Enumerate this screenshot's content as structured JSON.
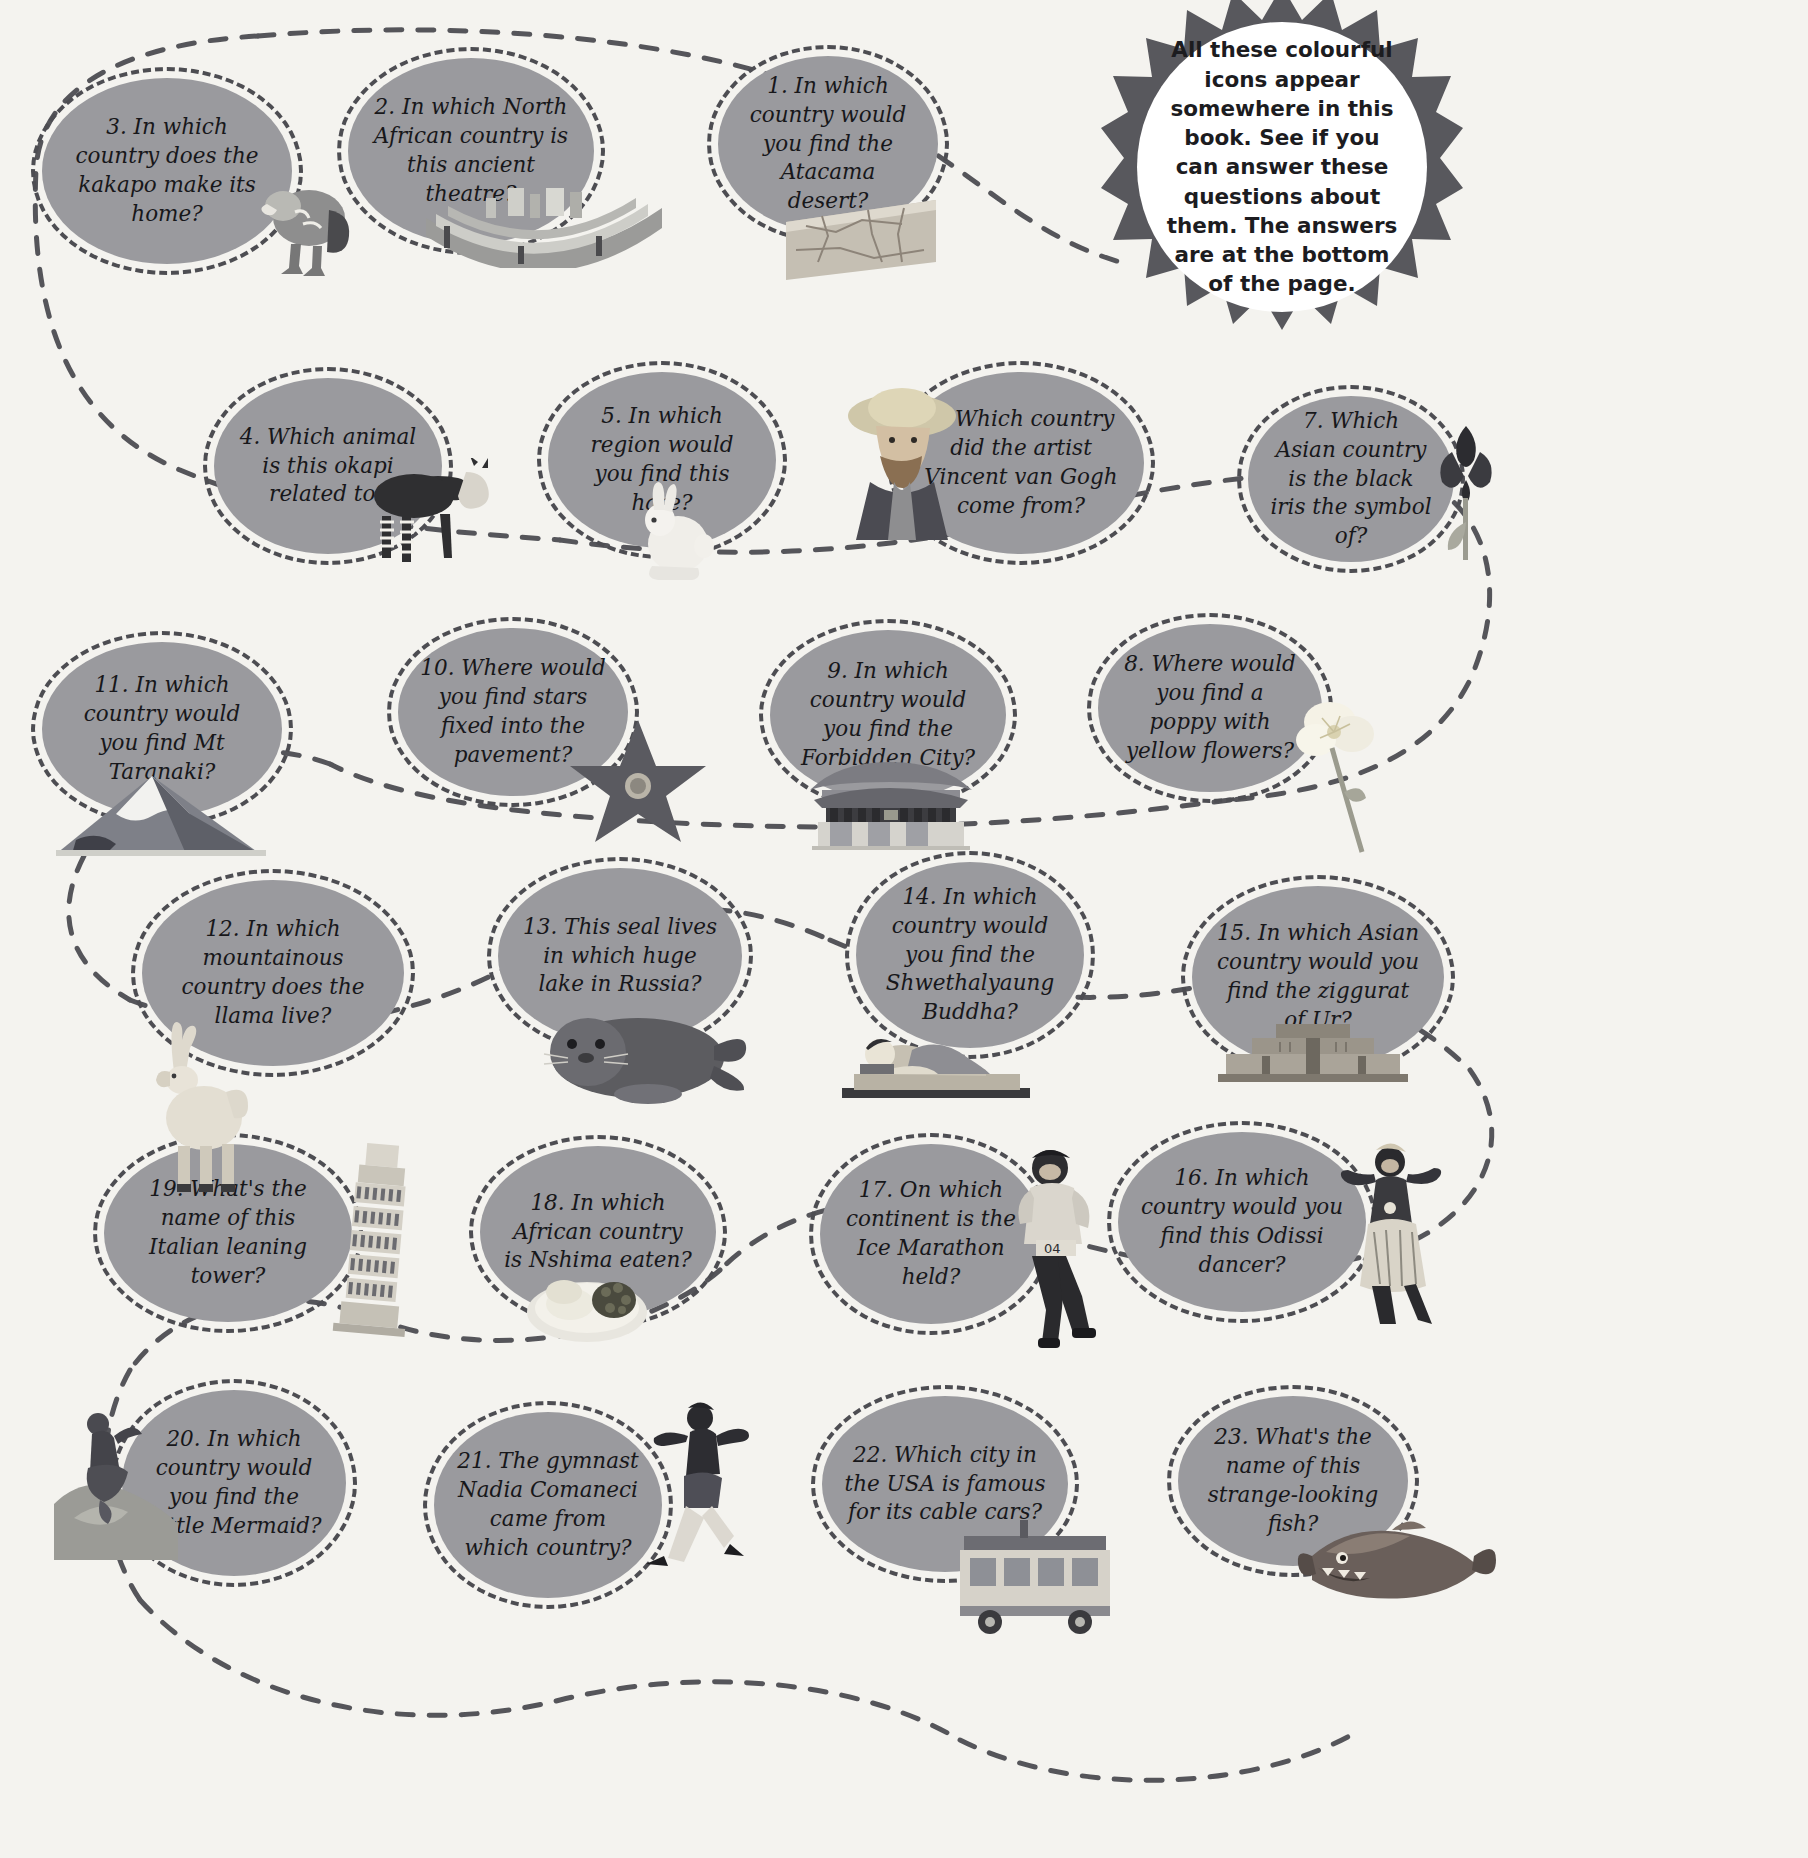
{
  "page": {
    "background_color": "#f4f3ef",
    "bubble_color": "#9a9a9e",
    "dash_color": "#4d4d52",
    "badge_color": "#58585d",
    "text_color": "#17171a"
  },
  "badge": {
    "text": "All these colourful icons appear somewhere in this book. See if you can answer these questions about them. The answers are at the bottom of the page."
  },
  "questions": [
    {
      "number": "1.",
      "text": "1. In which country would you find the Atacama desert?",
      "icon": "desert-icon"
    },
    {
      "number": "2.",
      "text": "2. In which North African country is this ancient theatre?",
      "icon": "ancient-theatre-icon"
    },
    {
      "number": "3.",
      "text": "3. In which country does the kakapo make its home?",
      "icon": "kakapo-bird-icon"
    },
    {
      "number": "4.",
      "text": "4. Which animal is this okapi related to?",
      "icon": "okapi-icon"
    },
    {
      "number": "5.",
      "text": "5. In which region would you find this hare?",
      "icon": "arctic-hare-icon"
    },
    {
      "number": "6.",
      "text": "6. Which country did the artist Vincent van Gogh come from?",
      "icon": "van-gogh-portrait-icon"
    },
    {
      "number": "7.",
      "text": "7. Which Asian country is the black iris the symbol of?",
      "icon": "black-iris-icon"
    },
    {
      "number": "8.",
      "text": "8. Where would you find a poppy with yellow flowers?",
      "icon": "yellow-poppy-icon"
    },
    {
      "number": "9.",
      "text": "9. In which country would you find the Forbidden City?",
      "icon": "forbidden-city-icon"
    },
    {
      "number": "10.",
      "text": "10. Where would you find stars fixed into the pavement?",
      "icon": "walk-of-fame-star-icon"
    },
    {
      "number": "11.",
      "text": "11. In which country would you find Mt Taranaki?",
      "icon": "mount-taranaki-icon"
    },
    {
      "number": "12.",
      "text": "12. In which mountainous country does the llama live?",
      "icon": "llama-icon"
    },
    {
      "number": "13.",
      "text": "13. This seal lives in which huge lake in Russia?",
      "icon": "baikal-seal-icon"
    },
    {
      "number": "14.",
      "text": "14. In which country would you find the Shwethalyaung Buddha?",
      "icon": "reclining-buddha-icon"
    },
    {
      "number": "15.",
      "text": "15. In which Asian country would you find the ziggurat of Ur?",
      "icon": "ziggurat-icon"
    },
    {
      "number": "16.",
      "text": "16. In which country would you find this Odissi dancer?",
      "icon": "odissi-dancer-icon"
    },
    {
      "number": "17.",
      "text": "17. On which continent is the Ice Marathon held?",
      "icon": "ice-marathon-runner-icon"
    },
    {
      "number": "18.",
      "text": "18. In which African country is Nshima eaten?",
      "icon": "nshima-dish-icon"
    },
    {
      "number": "19.",
      "text": "19. What's the name of this Italian leaning tower?",
      "icon": "leaning-tower-icon"
    },
    {
      "number": "20.",
      "text": "20. In which country would you find the Little Mermaid?",
      "icon": "little-mermaid-statue-icon"
    },
    {
      "number": "21.",
      "text": "21. The gymnast Nadia Comaneci came from which country?",
      "icon": "gymnast-icon"
    },
    {
      "number": "22.",
      "text": "22. Which city in the USA is famous for its cable cars?",
      "icon": "cable-car-icon"
    },
    {
      "number": "23.",
      "text": "23. What's the name of this strange-looking fish?",
      "icon": "strange-fish-icon"
    }
  ]
}
